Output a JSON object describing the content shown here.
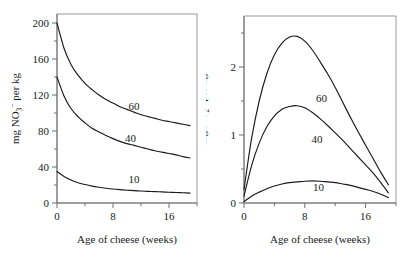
{
  "figure": {
    "background": "#ffffff",
    "curve_color": "#1a1a1a",
    "frame_color": "#9a9a9a",
    "axis_color": "#6f6f6f"
  },
  "chart_data": [
    {
      "type": "line",
      "panel": "left",
      "title": "",
      "xlabel": "Age of cheese (weeks)",
      "ylabel": "mg NO3- per kg",
      "ylabel_parts": {
        "prefix": "mg NO",
        "sub": "3",
        "sup": "−",
        "suffix": " per kg"
      },
      "xlim": [
        0,
        20
      ],
      "ylim": [
        0,
        210
      ],
      "xticks": [
        0,
        8,
        16
      ],
      "xtick_labels": [
        "0",
        "8",
        "16"
      ],
      "xminor": [
        4,
        12,
        20
      ],
      "yticks": [
        0,
        40,
        80,
        120,
        160,
        200
      ],
      "ytick_labels": [
        "0",
        "40",
        "80",
        "120",
        "160",
        "200"
      ],
      "yminor": [
        20,
        60,
        100,
        140,
        180
      ],
      "grid": false,
      "legend_position": "inline-labels",
      "x": [
        0,
        1,
        2,
        3,
        4,
        5,
        6,
        7,
        8,
        9,
        10,
        11,
        12,
        13,
        14,
        15,
        16,
        17,
        18,
        19
      ],
      "series": [
        {
          "name": "60",
          "label": "60",
          "label_x": 11.0,
          "label_y": 103,
          "values": [
            200,
            172,
            154,
            142,
            133,
            126,
            120,
            115,
            111,
            107,
            104,
            101,
            98,
            96,
            94,
            92,
            90.5,
            89,
            87.5,
            86
          ]
        },
        {
          "name": "40",
          "label": "40",
          "label_x": 10.5,
          "label_y": 68,
          "values": [
            140,
            119,
            105,
            96,
            89,
            83,
            79,
            75,
            71.5,
            68.5,
            66,
            64,
            62,
            60,
            58,
            56.5,
            55,
            53.5,
            51.5,
            50
          ]
        },
        {
          "name": "10",
          "label": "10",
          "label_x": 11.0,
          "label_y": 22,
          "values": [
            35,
            29.5,
            25.5,
            22.5,
            20.5,
            18.8,
            17.5,
            16.4,
            15.5,
            14.8,
            14.2,
            13.7,
            13.3,
            12.9,
            12.6,
            12.3,
            12.0,
            11.7,
            11.4,
            11.0
          ]
        }
      ]
    },
    {
      "type": "line",
      "panel": "right",
      "title": "",
      "xlabel": "Age of cheese (weeks)",
      "ylabel": "mg NO2- per kg",
      "ylabel_parts": {
        "prefix": "mg NO",
        "sub": "2",
        "sup": "−",
        "suffix": " per kg"
      },
      "xlim": [
        0,
        20
      ],
      "ylim": [
        0,
        2.75
      ],
      "xticks": [
        0,
        8,
        16
      ],
      "xtick_labels": [
        "0",
        "8",
        "16"
      ],
      "xminor": [
        4,
        12,
        20
      ],
      "yticks": [
        0,
        1,
        2
      ],
      "ytick_labels": [
        "0",
        "1",
        "2"
      ],
      "yminor": [
        0.5,
        1.5,
        2.5
      ],
      "grid": false,
      "legend_position": "inline-labels",
      "x": [
        0,
        1,
        2,
        3,
        4,
        5,
        6,
        7,
        8,
        9,
        10,
        11,
        12,
        13,
        14,
        15,
        16,
        17,
        18,
        19
      ],
      "series": [
        {
          "name": "60",
          "label": "60",
          "label_x": 10.2,
          "label_y": 1.48,
          "values": [
            0.2,
            0.95,
            1.5,
            1.9,
            2.18,
            2.35,
            2.44,
            2.45,
            2.38,
            2.25,
            2.08,
            1.9,
            1.7,
            1.48,
            1.26,
            1.05,
            0.85,
            0.65,
            0.45,
            0.27
          ]
        },
        {
          "name": "40",
          "label": "40",
          "label_x": 9.6,
          "label_y": 0.88,
          "values": [
            0.1,
            0.55,
            0.88,
            1.12,
            1.28,
            1.38,
            1.42,
            1.43,
            1.4,
            1.33,
            1.24,
            1.14,
            1.03,
            0.92,
            0.8,
            0.68,
            0.56,
            0.44,
            0.3,
            0.15
          ]
        },
        {
          "name": "10",
          "label": "10",
          "label_x": 9.8,
          "label_y": 0.17,
          "values": [
            0.02,
            0.1,
            0.16,
            0.21,
            0.25,
            0.28,
            0.3,
            0.31,
            0.32,
            0.325,
            0.32,
            0.31,
            0.3,
            0.28,
            0.26,
            0.23,
            0.2,
            0.17,
            0.13,
            0.08
          ]
        }
      ]
    }
  ]
}
